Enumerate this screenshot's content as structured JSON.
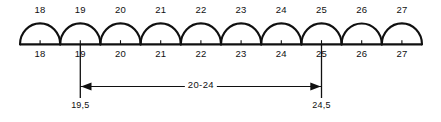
{
  "figure": {
    "stroke_color": "#101010",
    "background_color": "#ffffff",
    "bins": [
      {
        "top_label": "18",
        "bottom_label": "18",
        "center_value": 18
      },
      {
        "top_label": "19",
        "bottom_label": "19",
        "center_value": 19
      },
      {
        "top_label": "20",
        "bottom_label": "20",
        "center_value": 20
      },
      {
        "top_label": "21",
        "bottom_label": "21",
        "center_value": 21
      },
      {
        "top_label": "22",
        "bottom_label": "22",
        "center_value": 22
      },
      {
        "top_label": "23",
        "bottom_label": "23",
        "center_value": 23
      },
      {
        "top_label": "24",
        "bottom_label": "24",
        "center_value": 24
      },
      {
        "top_label": "25",
        "bottom_label": "25",
        "center_value": 25
      },
      {
        "top_label": "26",
        "bottom_label": "26",
        "center_value": 26
      },
      {
        "top_label": "27",
        "bottom_label": "27",
        "center_value": 27
      }
    ],
    "dimension": {
      "range_label": "20-24",
      "left_boundary_label": "19,5",
      "right_boundary_label": "24,5",
      "left_boundary_value": 19.5,
      "right_boundary_value": 24.5
    }
  },
  "chart_data": {
    "type": "bar",
    "title": "",
    "xlabel": "",
    "ylabel": "",
    "categories": [
      "18",
      "19",
      "20",
      "21",
      "22",
      "23",
      "24",
      "25",
      "26",
      "27"
    ],
    "values": [
      1,
      1,
      1,
      1,
      1,
      1,
      1,
      1,
      1,
      1
    ],
    "grid": false,
    "legend": "none",
    "annotations": [
      {
        "text": "20-24",
        "from": 19.5,
        "to": 24.5,
        "kind": "span-arrow"
      },
      {
        "text": "19,5",
        "at": 19.5,
        "kind": "boundary-label"
      },
      {
        "text": "24,5",
        "at": 24.5,
        "kind": "boundary-label"
      }
    ]
  }
}
